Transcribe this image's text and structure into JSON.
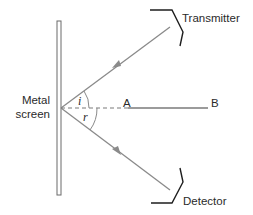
{
  "diagram": {
    "labels": {
      "transmitter": "Transmitter",
      "detector": "Detector",
      "screen_line1": "Metal",
      "screen_line2": "screen",
      "point_a": "A",
      "point_b": "B",
      "angle_incidence": "i",
      "angle_reflection": "r"
    },
    "colors": {
      "ray": "#8a8a8a",
      "bracket": "#1e1e1e",
      "screen": "#6a6a6a",
      "normal": "#7a7a7a",
      "text": "#2a2a2a"
    },
    "elements": [
      {
        "id": "metal-screen",
        "type": "vertical bar",
        "from": [
          59,
          21
        ],
        "to": [
          59,
          195
        ]
      },
      {
        "id": "incident-ray",
        "type": "arrow",
        "from": [
          170,
          27
        ],
        "to": [
          61,
          108
        ]
      },
      {
        "id": "reflected-ray",
        "type": "arrow",
        "from": [
          61,
          108
        ],
        "to": [
          170,
          190
        ]
      },
      {
        "id": "normal-dashed",
        "type": "dashed line",
        "from": [
          61,
          108
        ],
        "to": [
          128,
          108
        ]
      },
      {
        "id": "line-ab",
        "type": "line",
        "from": [
          128,
          108
        ],
        "to": [
          208,
          108
        ]
      }
    ]
  }
}
